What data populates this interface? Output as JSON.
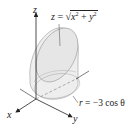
{
  "figure": {
    "axes": {
      "x_label": "x",
      "y_label": "y",
      "z_label": "z"
    },
    "surface_label": {
      "lhs": "z",
      "eq": "=",
      "radicand_a": "x",
      "radicand_b": "y",
      "exponent": "2",
      "plus": "+",
      "full": "z = √(x² + y²)"
    },
    "cylinder_label": {
      "lhs": "r",
      "eq": "=",
      "rhs": "−3 cos θ",
      "full": "r = −3 cos θ"
    },
    "colors": {
      "fill": "#eeeeee",
      "stroke": "#9a9a9a",
      "axis": "#222222"
    }
  }
}
